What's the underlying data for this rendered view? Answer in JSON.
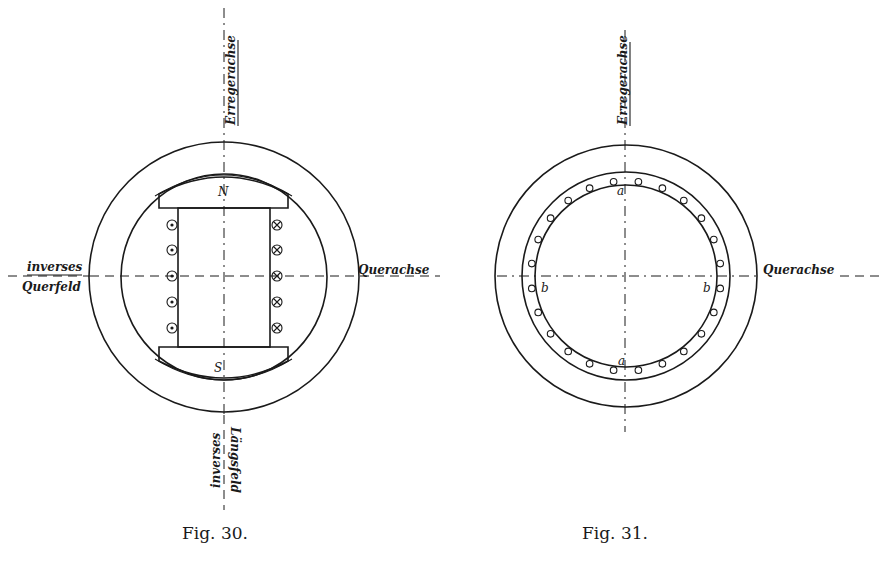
{
  "figures": [
    {
      "id": "fig30",
      "caption": "Fig. 30.",
      "axis_labels": {
        "top": "Erregerachse",
        "left_line1": "inverses",
        "left_line2": "Querfeld",
        "right": "Querachse",
        "bottom_line1": "inverses",
        "bottom_line2": "Längsfeld"
      },
      "pole_labels": {
        "north": "N",
        "south": "S"
      },
      "conductors_left": [
        "dot",
        "dot",
        "dot",
        "dot",
        "dot"
      ],
      "conductors_right": [
        "cross",
        "cross",
        "cross",
        "cross",
        "cross"
      ]
    },
    {
      "id": "fig31",
      "caption": "Fig. 31.",
      "axis_labels": {
        "top": "Erregerachse",
        "right": "Querachse"
      },
      "point_labels": {
        "top": "a",
        "bottom": "a",
        "left": "b",
        "right": "b"
      },
      "slot_count": 24
    }
  ],
  "colors": {
    "ink": "#1a1a1a",
    "paper": "#ffffff"
  }
}
